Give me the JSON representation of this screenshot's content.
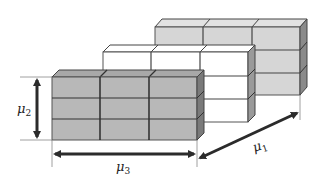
{
  "diagram": {
    "type": "3d-block-stack",
    "layers": [
      {
        "name": "back",
        "cols": 3,
        "rows": 3,
        "fill_front": "#d6d6d6",
        "fill_top": "#e2e2e2",
        "fill_side": "#8a8a8a"
      },
      {
        "name": "middle",
        "cols": 3,
        "rows": 3,
        "fill_front": "#ffffff",
        "fill_top": "#ffffff",
        "fill_side": "#9a9a9a"
      },
      {
        "name": "front",
        "cols": 3,
        "rows": 3,
        "fill_front": "#b8b8b8",
        "fill_top": "#a8a8a8",
        "fill_side": "#7a7a7a"
      }
    ],
    "edge_color": "#333333",
    "arrow_color": "#2b2b2b"
  },
  "labels": {
    "mu1": {
      "base": "μ",
      "sub": "1"
    },
    "mu2": {
      "base": "μ",
      "sub": "2"
    },
    "mu3": {
      "base": "μ",
      "sub": "3"
    }
  }
}
